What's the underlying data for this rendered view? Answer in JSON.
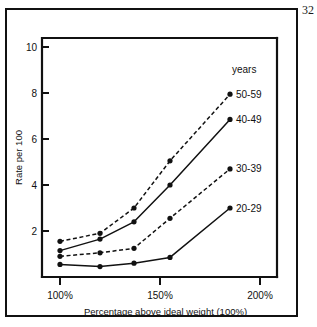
{
  "page": {
    "number": "32"
  },
  "chart_data": {
    "type": "line",
    "title": "",
    "xlabel": "Percentage above ideal weight (100%)",
    "ylabel": "Rate per 100",
    "legend_header": "years",
    "legend_position": "right-inline",
    "grid": false,
    "xlim": [
      100,
      200
    ],
    "ylim": [
      0,
      11
    ],
    "xtick_labels": [
      "100%",
      "150%",
      "200%"
    ],
    "xtick_values": [
      100,
      150,
      200
    ],
    "ytick_labels": [
      "2",
      "4",
      "6",
      "8",
      "10"
    ],
    "ytick_values": [
      2,
      4,
      6,
      8,
      10
    ],
    "x": [
      100,
      120,
      137,
      155,
      185
    ],
    "series": [
      {
        "name": "50-59",
        "style": "dashed",
        "marker": "circle",
        "values": [
          1.55,
          1.9,
          3.0,
          5.05,
          7.95
        ]
      },
      {
        "name": "40-49",
        "style": "solid",
        "marker": "circle",
        "values": [
          1.15,
          1.65,
          2.4,
          4.0,
          6.85
        ]
      },
      {
        "name": "30-39",
        "style": "dashed",
        "marker": "circle",
        "values": [
          0.9,
          1.05,
          1.25,
          2.55,
          4.7
        ]
      },
      {
        "name": "20-29",
        "style": "solid",
        "marker": "circle",
        "values": [
          0.55,
          0.45,
          0.6,
          0.85,
          3.0
        ]
      }
    ],
    "colors": {
      "ink": "#111111",
      "background": "#ffffff"
    }
  }
}
